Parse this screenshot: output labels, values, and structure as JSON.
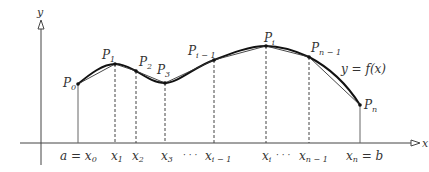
{
  "diagram": {
    "type": "polygonal approximation of a curve (arc length)",
    "axes": {
      "x_label": "x",
      "y_label": "y"
    },
    "curve_label": "y = f(x)",
    "points": [
      {
        "name": "P",
        "sub": "0",
        "label": "P0",
        "px": 78,
        "py": 84
      },
      {
        "name": "P",
        "sub": "1",
        "label": "P1",
        "px": 115,
        "py": 64
      },
      {
        "name": "P",
        "sub": "2",
        "label": "P2",
        "px": 136,
        "py": 71
      },
      {
        "name": "P",
        "sub": "3",
        "label": "P3",
        "px": 165,
        "py": 83
      },
      {
        "name": "P",
        "sub": "i − 1",
        "label": "Pi-1",
        "px": 214,
        "py": 60
      },
      {
        "name": "P",
        "sub": "i",
        "label": "Pi",
        "px": 266,
        "py": 46
      },
      {
        "name": "P",
        "sub": "n − 1",
        "label": "Pn-1",
        "px": 309,
        "py": 57
      },
      {
        "name": "P",
        "sub": "n",
        "label": "Pn",
        "px": 360,
        "py": 105
      }
    ],
    "x_ticks": [
      {
        "pre": "a = ",
        "name": "x",
        "sub": "0"
      },
      {
        "pre": "",
        "name": "x",
        "sub": "1"
      },
      {
        "pre": "",
        "name": "x",
        "sub": "2"
      },
      {
        "pre": "",
        "name": "x",
        "sub": "3"
      },
      {
        "pre": "",
        "name": "x",
        "sub": "i − 1"
      },
      {
        "pre": "",
        "name": "x",
        "sub": "i"
      },
      {
        "pre": "",
        "name": "x",
        "sub": "n − 1"
      },
      {
        "pre": "",
        "name": "x",
        "sub": "n",
        "post": " = b"
      }
    ],
    "ellipsis": "· · ·"
  }
}
